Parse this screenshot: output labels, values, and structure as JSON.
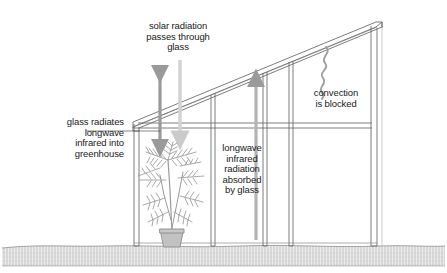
{
  "diagram": {
    "labels": {
      "solar": "solar radiation\npasses through\nglass",
      "glass_radiates": "glass radiates\nlongwave\ninfrared into\ngreenhouse",
      "longwave_absorbed": "longwave\ninfrared\nradiation\nabsorbed\nby glass",
      "convection": "convection\nis blocked"
    },
    "elements": {
      "plant": "potted-palm-plant",
      "ground": "ground-hatching-band",
      "roof": "sloped-glass-roof",
      "left_wall": "left-glass-wall",
      "right_wall": "right-glass-pillar",
      "beam": "horizontal-glazing-bar",
      "mullions": "vertical-glazing-bars"
    },
    "arrows": {
      "solar_down": "downward-light-gray-arrow",
      "glass_radiates_double": "double-headed-vertical-arrow",
      "longwave_up": "upward-gray-arrow",
      "convection_squiggle": "wavy-convection-line"
    },
    "colors": {
      "line": "#6e6e6e",
      "arrow_dark": "#8d8d8d",
      "arrow_light": "#cfcfcf",
      "plant": "#9a9a9a",
      "ground": "#b9b9b9",
      "text": "#1a1a1a"
    }
  }
}
